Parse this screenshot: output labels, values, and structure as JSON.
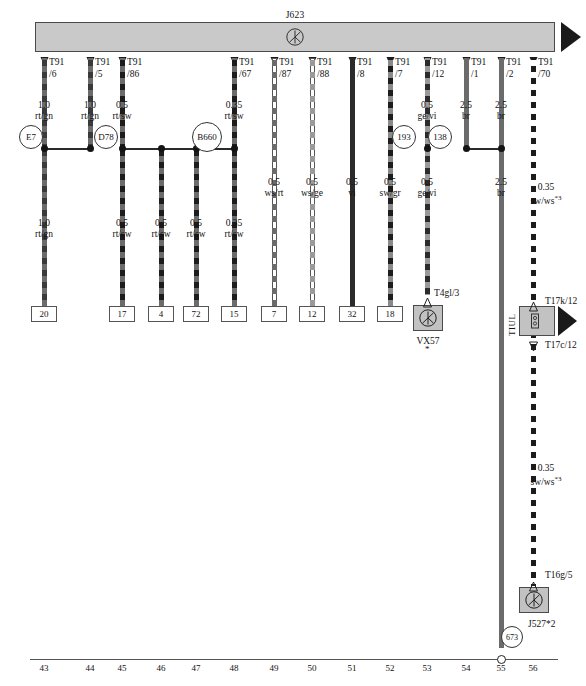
{
  "sheet": {
    "width": 586,
    "height": 686
  },
  "module": {
    "title": "J623",
    "symbol_icon": "ground-symbol-icon"
  },
  "pins": [
    {
      "id": "p6",
      "x": 44,
      "connector": "T91",
      "cavity": "/6"
    },
    {
      "id": "p5",
      "x": 90,
      "connector": "T91",
      "cavity": "/5"
    },
    {
      "id": "p86",
      "x": 122,
      "connector": "T91",
      "cavity": "/86"
    },
    {
      "id": "p67",
      "x": 234,
      "connector": "T91",
      "cavity": "/67"
    },
    {
      "id": "p87",
      "x": 274,
      "connector": "T91",
      "cavity": "/87"
    },
    {
      "id": "p88",
      "x": 312,
      "connector": "T91",
      "cavity": "/88"
    },
    {
      "id": "p8",
      "x": 352,
      "connector": "T91",
      "cavity": "/8"
    },
    {
      "id": "p7",
      "x": 390,
      "connector": "T91",
      "cavity": "/7"
    },
    {
      "id": "p12",
      "x": 427,
      "connector": "T91",
      "cavity": "/12"
    },
    {
      "id": "p1",
      "x": 466,
      "connector": "T91",
      "cavity": "/1"
    },
    {
      "id": "p2",
      "x": 501,
      "connector": "T91",
      "cavity": "/2"
    },
    {
      "id": "p70",
      "x": 533,
      "connector": "T91",
      "cavity": "/70"
    }
  ],
  "upper_wire_specs": [
    {
      "x": 44,
      "size": "1.0",
      "colors": "rt/gn"
    },
    {
      "x": 90,
      "size": "1.0",
      "colors": "rt/gn"
    },
    {
      "x": 122,
      "size": "0.5",
      "colors": "rt/sw"
    },
    {
      "x": 234,
      "size": "0.35",
      "colors": "rt/sw"
    },
    {
      "x": 427,
      "size": "0.5",
      "colors": "ge/vi"
    },
    {
      "x": 466,
      "size": "2.5",
      "colors": "br"
    },
    {
      "x": 501,
      "size": "2.5",
      "colors": "br"
    }
  ],
  "mid_wire_specs": [
    {
      "x": 274,
      "size": "0.5",
      "colors": "ws/rt"
    },
    {
      "x": 312,
      "size": "0.5",
      "colors": "ws/ge"
    },
    {
      "x": 352,
      "size": "0.5",
      "colors": "vi"
    },
    {
      "x": 390,
      "size": "0.5",
      "colors": "sw/gr"
    },
    {
      "x": 427,
      "size": "0.5",
      "colors": "ge/vi"
    },
    {
      "x": 501,
      "size": "2.5",
      "colors": "br"
    }
  ],
  "lower_wire_specs": [
    {
      "x": 44,
      "size": "1.0",
      "colors": "rt/gn"
    },
    {
      "x": 122,
      "size": "0.5",
      "colors": "rt/sw"
    },
    {
      "x": 161,
      "size": "0.5",
      "colors": "rt/sw"
    },
    {
      "x": 196,
      "size": "0.5",
      "colors": "rt/sw"
    },
    {
      "x": 234,
      "size": "0.35",
      "colors": "rt/sw"
    }
  ],
  "sw_ws_labels": [
    {
      "x": 546,
      "y": 182,
      "size": "0.35",
      "colors": "sw/ws",
      "note": "*3"
    },
    {
      "x": 546,
      "y": 463,
      "size": "0.35",
      "colors": "sw/ws",
      "note": "*3"
    }
  ],
  "badges": [
    {
      "label": "E7",
      "x": 31,
      "y": 137
    },
    {
      "label": "D78",
      "x": 106,
      "y": 137
    },
    {
      "label": "B660",
      "x": 207,
      "y": 137
    },
    {
      "label": "193",
      "x": 404,
      "y": 137
    },
    {
      "label": "138",
      "x": 440,
      "y": 137
    },
    {
      "label": "673",
      "x": 512,
      "y": 637
    }
  ],
  "terminal_boxes": [
    {
      "label": "20",
      "x": 44
    },
    {
      "label": "17",
      "x": 122
    },
    {
      "label": "4",
      "x": 161
    },
    {
      "label": "72",
      "x": 196
    },
    {
      "label": "15",
      "x": 234
    },
    {
      "label": "7",
      "x": 274
    },
    {
      "label": "12",
      "x": 312
    },
    {
      "label": "32",
      "x": 352
    },
    {
      "label": "18",
      "x": 390
    }
  ],
  "components": [
    {
      "id": "vx57",
      "name": "VX57",
      "connector": "T4gl/3",
      "star": "*",
      "x": 427,
      "y": 320,
      "icon": "ground-symbol-icon"
    },
    {
      "id": "tiul",
      "name": "TIUL",
      "connector_top": "T17k/12",
      "connector_bottom": "T17c/12",
      "x": 533,
      "y": 322,
      "icon": "splice-block-icon"
    },
    {
      "id": "j527",
      "name": "J527*2",
      "connector": "T16g/5",
      "x": 533,
      "y": 599,
      "icon": "ground-symbol-icon"
    }
  ],
  "ruler": {
    "y": 659,
    "numbers": [
      "43",
      "44",
      "45",
      "46",
      "47",
      "48",
      "49",
      "50",
      "51",
      "52",
      "53",
      "54",
      "55",
      "56"
    ],
    "positions": [
      44,
      90,
      122,
      161,
      196,
      234,
      274,
      312,
      352,
      390,
      427,
      466,
      501,
      533
    ],
    "junction_at": 501
  },
  "colors": {
    "module_fill": "#c9c9c9",
    "component_fill": "#c2c2c2",
    "wire_dark": "#2b2b2b",
    "wire_red": "#4a4a4a",
    "stroke": "#4a4a4a",
    "background": "#ffffff"
  }
}
